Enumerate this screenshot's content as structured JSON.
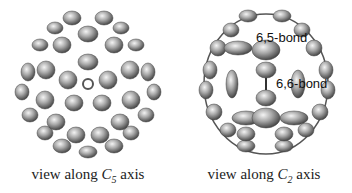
{
  "figure": {
    "panels": [
      {
        "id": "c5",
        "caption_prefix": "view along ",
        "axis_symbol": "C",
        "axis_subscript": "5",
        "caption_suffix": " axis"
      },
      {
        "id": "c2",
        "caption_prefix": "view along ",
        "axis_symbol": "C",
        "axis_subscript": "2",
        "caption_suffix": " axis",
        "labels": [
          "6,5-bond",
          "6,6-bond"
        ]
      }
    ]
  }
}
